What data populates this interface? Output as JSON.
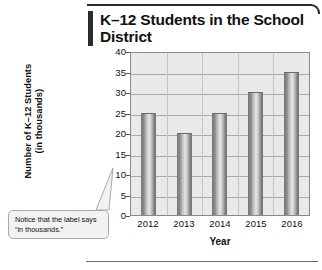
{
  "chart_data": {
    "type": "bar",
    "title": "K–12 Students in the School District",
    "categories": [
      "2012",
      "2013",
      "2014",
      "2015",
      "2016"
    ],
    "values": [
      25,
      20,
      25,
      30,
      35
    ],
    "xlabel": "Year",
    "ylabel": "Number of K–12 Students (in thousands)",
    "ylabel_line1": "Number of K–12 Students",
    "ylabel_line2": "(in thousands)",
    "ylim": [
      0,
      40
    ],
    "ytick_step": 5,
    "yticks": [
      "0",
      "5",
      "10",
      "15",
      "20",
      "25",
      "30",
      "35",
      "40"
    ],
    "grid": true,
    "legend": "none",
    "bar_color": "#b0b0b0",
    "plot_background": "#e9e9e9",
    "annotations": [
      {
        "name": "in-thousands-callout",
        "text": "Notice that the label says “in thousands.”",
        "points_to": "ylabel"
      }
    ]
  },
  "header": {
    "title_line1": "K–12 Students in the School",
    "title_line2": "District"
  },
  "callout": {
    "text": "Notice that the label says “in thousands.”"
  },
  "axes": {
    "x_title": "Year",
    "y_title_line1": "Number of K–12 Students",
    "y_title_line2": "(in thousands)"
  }
}
